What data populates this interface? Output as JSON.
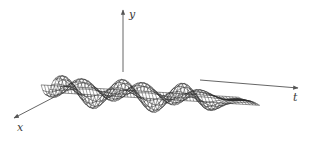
{
  "figure": {
    "colors": {
      "background": "#ffffff",
      "mesh": "#2b2b2b",
      "axis": "#555555",
      "label": "#3a3a3a"
    }
  },
  "axes": {
    "x": {
      "label": "x",
      "tail": [
        62,
        93
      ],
      "head": [
        14,
        118
      ],
      "label_pos": [
        17,
        122
      ]
    },
    "y": {
      "label": "y",
      "tail": [
        123,
        72
      ],
      "head": [
        123,
        10
      ],
      "label_pos": [
        129,
        9
      ]
    },
    "t": {
      "label": "t",
      "tail": [
        200,
        80
      ],
      "head": [
        298,
        88
      ],
      "label_pos": [
        293,
        92
      ]
    }
  },
  "surface": {
    "origin": [
      62,
      93
    ],
    "t_vector": [
      1.52,
      0.095
    ],
    "x_vector": [
      0.62,
      0.42
    ],
    "y_scale": 26,
    "t_range": [
      0,
      130
    ],
    "x_range": [
      0,
      55
    ],
    "t_lines": 60,
    "x_lines": 12,
    "wave": {
      "type": "standing-wave-envelope",
      "t_frequency": 0.072,
      "x_frequency": 0.057,
      "decay_start": 95,
      "decay_rate": 0.06
    }
  }
}
